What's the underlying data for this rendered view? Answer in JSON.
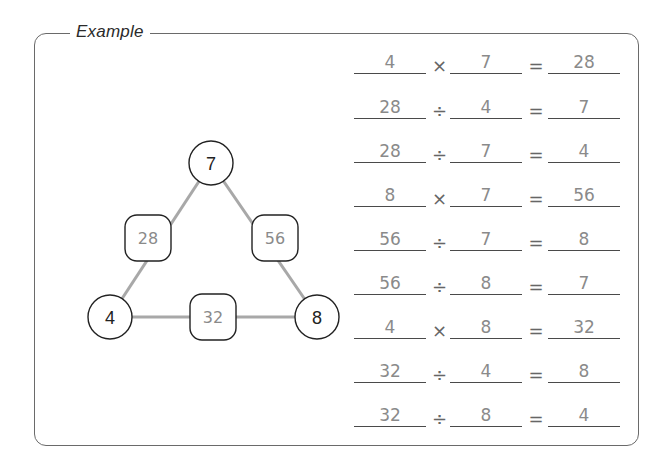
{
  "example": {
    "title": "Example"
  },
  "triangle": {
    "corners": {
      "top": "7",
      "left": "4",
      "right": "8"
    },
    "edges": {
      "left": "28",
      "right": "56",
      "bottom": "32"
    }
  },
  "colors": {
    "answer_text": "#8a8a8a",
    "node_border": "#222222",
    "connector": "#a8a8a8",
    "frame": "#6a6a6a"
  },
  "equations": [
    {
      "a": "4",
      "op": "×",
      "b": "7",
      "eq": "=",
      "c": "28"
    },
    {
      "a": "28",
      "op": "÷",
      "b": "4",
      "eq": "=",
      "c": "7"
    },
    {
      "a": "28",
      "op": "÷",
      "b": "7",
      "eq": "=",
      "c": "4"
    },
    {
      "a": "8",
      "op": "×",
      "b": "7",
      "eq": "=",
      "c": "56"
    },
    {
      "a": "56",
      "op": "÷",
      "b": "7",
      "eq": "=",
      "c": "8"
    },
    {
      "a": "56",
      "op": "÷",
      "b": "8",
      "eq": "=",
      "c": "7"
    },
    {
      "a": "4",
      "op": "×",
      "b": "8",
      "eq": "=",
      "c": "32"
    },
    {
      "a": "32",
      "op": "÷",
      "b": "4",
      "eq": "=",
      "c": "8"
    },
    {
      "a": "32",
      "op": "÷",
      "b": "8",
      "eq": "=",
      "c": "4"
    }
  ]
}
